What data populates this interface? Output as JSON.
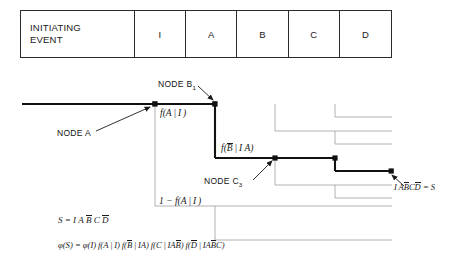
{
  "header": {
    "columns": [
      {
        "id": "initiating-event",
        "label": "INITIATING\nEVENT"
      },
      {
        "id": "i",
        "label": "I"
      },
      {
        "id": "a",
        "label": "A"
      },
      {
        "id": "b",
        "label": "B"
      },
      {
        "id": "c",
        "label": "C"
      },
      {
        "id": "d",
        "label": "D"
      }
    ],
    "initiating_line1": "INITIATING",
    "initiating_line2": "EVENT",
    "col_i": "I",
    "col_a": "A",
    "col_b": "B",
    "col_c": "C",
    "col_d": "D"
  },
  "diagram": {
    "node_a_label": "NODE A",
    "node_b_label": "NODE B",
    "node_b_sub": "1",
    "node_c_label": "NODE C",
    "node_c_sub": "3",
    "branch_prob_a": {
      "f": "f",
      "open": "(",
      "var": "A",
      "bar": "I",
      "close": ")"
    },
    "branch_prob_a_text": "f(A | I)",
    "branch_prob_b_text": "f(B̅ | I A)",
    "branch_prob_not_a_text": "1 − f(A | I)",
    "outcome_text": "IAB̅C̅D̅ = S",
    "line_color": "#2b2b2b",
    "path_color": "#111111",
    "thin_color": "#9a9a9a"
  },
  "equations": {
    "s_def_prefix": "S =",
    "s_def_text": "S = I A B̅ C D̅",
    "phi_text": "φ(S) = φ(I) f(A | I) f(B̅ | IA) f(C | IAB̅) f(D̅ | IAB̅C)",
    "phi_lhs": "φ(S) =",
    "phi_terms": [
      "φ(I)",
      "f(A | I)",
      "f(B̅ | IA)",
      "f(C | IAB̅)",
      "f(D̅ | IAB̅C)"
    ]
  }
}
